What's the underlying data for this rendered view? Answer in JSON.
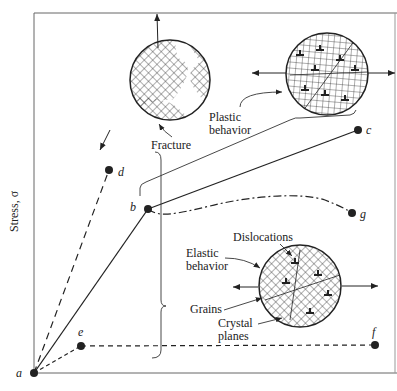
{
  "axes": {
    "ylabel": "Stress, σ"
  },
  "points": {
    "a": "a",
    "b": "b",
    "c": "c",
    "d": "d",
    "e": "e",
    "f": "f",
    "g": "g"
  },
  "labels": {
    "fracture": "Fracture",
    "plastic_line1": "Plastic",
    "plastic_line2": "behavior",
    "elastic_line1": "Elastic",
    "elastic_line2": "behavior",
    "dislocations": "Dislocations",
    "grains": "Grains",
    "crystal_line1": "Crystal",
    "crystal_line2": "planes"
  },
  "colors": {
    "ink": "#222222",
    "background": "#ffffff",
    "frame": "#555555"
  }
}
